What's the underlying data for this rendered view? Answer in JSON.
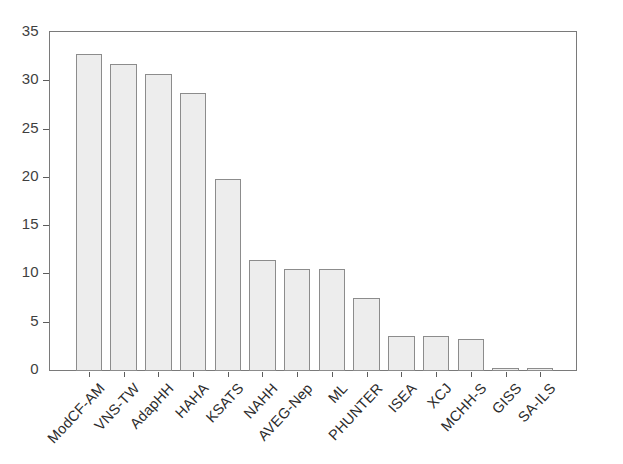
{
  "chart_data": {
    "type": "bar",
    "title": "",
    "subtitle": "",
    "xlabel": "",
    "ylabel": "",
    "categories": [
      "ModCF-AM",
      "VNS-TW",
      "AdapHH",
      "HAHA",
      "KSATS",
      "NAHH",
      "AVEG-Nep",
      "ML",
      "PHUNTER",
      "ISEA",
      "XCJ",
      "MCHH-S",
      "GISS",
      "SA-ILS"
    ],
    "values": [
      32.8,
      31.8,
      30.8,
      28.8,
      19.9,
      11.5,
      10.6,
      10.6,
      7.6,
      3.6,
      3.6,
      3.3,
      0.3,
      0.3
    ],
    "ylim": [
      0,
      35
    ],
    "xlim_note": "categorical",
    "ytick_labels": [
      "35",
      "30",
      "25",
      "20",
      "15",
      "10",
      "5",
      "0"
    ],
    "ytick_values": [
      35,
      30,
      25,
      20,
      15,
      10,
      5,
      0
    ],
    "grid": false,
    "legend": null,
    "legend_position": "none",
    "colors": {
      "bar_fill": "#ededed",
      "bar_edge": "#8c8c8c",
      "axis": "#7a7a7a",
      "tick_text": "#3f3f3f",
      "label_text": "#2c2c2c",
      "background": "#ffffff"
    }
  }
}
